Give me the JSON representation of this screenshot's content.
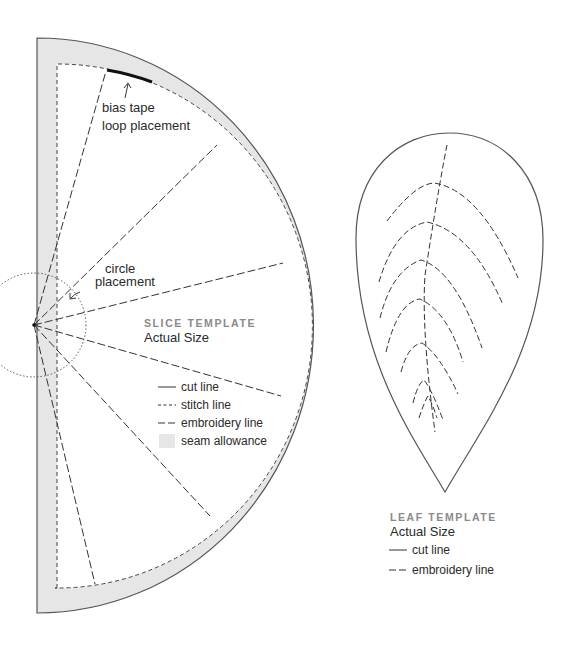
{
  "slice": {
    "annotations": {
      "bias_tape_line1": "bias tape",
      "bias_tape_line2": "loop placement",
      "circle_line1": "circle",
      "circle_line2": "placement"
    },
    "title": "SLICE TEMPLATE",
    "subtitle": "Actual Size",
    "legend": [
      {
        "style": "solid",
        "label": "cut line"
      },
      {
        "style": "dotted-dash",
        "label": "stitch line"
      },
      {
        "style": "long-dash",
        "label": "embroidery line"
      },
      {
        "style": "fill",
        "label": "seam allowance"
      }
    ]
  },
  "leaf": {
    "title": "LEAF TEMPLATE",
    "subtitle": "Actual Size",
    "legend": [
      {
        "style": "solid",
        "label": "cut line"
      },
      {
        "style": "long-dash",
        "label": "embroidery line"
      }
    ]
  },
  "colors": {
    "seam_allowance": "#e6e6e6",
    "line": "#444444",
    "title_gray": "#8a8a8a"
  }
}
